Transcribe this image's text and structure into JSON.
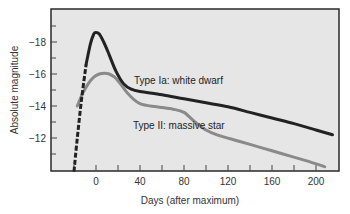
{
  "chart_data": {
    "type": "line",
    "title": "",
    "xlabel": "Days (after maximum)",
    "ylabel": "Absolute magnitude",
    "xlim": [
      -40,
      220
    ],
    "ylim": [
      -9.9,
      -20.1
    ],
    "y_inverted": true,
    "x_ticks": [
      0,
      40,
      80,
      120,
      160,
      200
    ],
    "x_tick_labels": [
      "0",
      "40",
      "80",
      "120",
      "160",
      "200"
    ],
    "x_minor_ticks": [
      -20,
      20,
      60,
      100,
      140,
      180
    ],
    "y_ticks": [
      -18,
      -16,
      -14,
      -12
    ],
    "y_tick_labels": [
      "−18",
      "−16",
      "−14",
      "−12"
    ],
    "y_minor_ticks": [
      -19,
      -17,
      -15,
      -13,
      -11
    ],
    "grid": false,
    "legend": null,
    "background": "#e6e6e6",
    "series": [
      {
        "name": "Type Ia: white dwarf",
        "color": "#222222",
        "rising_segment_style": "dashed",
        "x": [
          -20,
          -17,
          -13,
          -9,
          -5,
          -2,
          0,
          3,
          7,
          12,
          18,
          25,
          32,
          40,
          60,
          80,
          100,
          120,
          140,
          160,
          180,
          200,
          215
        ],
        "y": [
          -9.9,
          -12.0,
          -14.5,
          -16.6,
          -17.9,
          -18.5,
          -18.6,
          -18.5,
          -18.0,
          -17.2,
          -16.2,
          -15.4,
          -15.05,
          -14.9,
          -14.7,
          -14.45,
          -14.2,
          -13.95,
          -13.6,
          -13.25,
          -12.9,
          -12.5,
          -12.2
        ]
      },
      {
        "name": "Type II: massive star",
        "color": "#8a8a8a",
        "x": [
          -17,
          -12,
          -7,
          -2,
          3,
          8,
          12,
          17,
          22,
          30,
          40,
          55,
          70,
          80,
          90,
          100,
          110,
          130,
          150,
          170,
          190,
          208
        ],
        "y": [
          -14.0,
          -14.8,
          -15.4,
          -15.8,
          -16.0,
          -16.05,
          -16.0,
          -15.8,
          -15.4,
          -14.7,
          -14.15,
          -13.95,
          -13.8,
          -13.6,
          -13.0,
          -12.5,
          -12.2,
          -11.8,
          -11.4,
          -11.0,
          -10.6,
          -10.2
        ]
      }
    ],
    "annotations": [
      {
        "text": "Type Ia: white dwarf",
        "x": 35,
        "y": -17.15
      },
      {
        "text": "Type II: massive star",
        "x": 34,
        "y": -11.95
      }
    ]
  },
  "labels": {
    "xlabel": "Days (after maximum)",
    "ylabel": "Absolute magnitude",
    "anno_ia": "Type Ia: white dwarf",
    "anno_ii": "Type II: massive star",
    "xt0": "0",
    "xt1": "40",
    "xt2": "80",
    "xt3": "120",
    "xt4": "160",
    "xt5": "200",
    "yt0": "−18",
    "yt1": "−16",
    "yt2": "−14",
    "yt3": "−12"
  }
}
